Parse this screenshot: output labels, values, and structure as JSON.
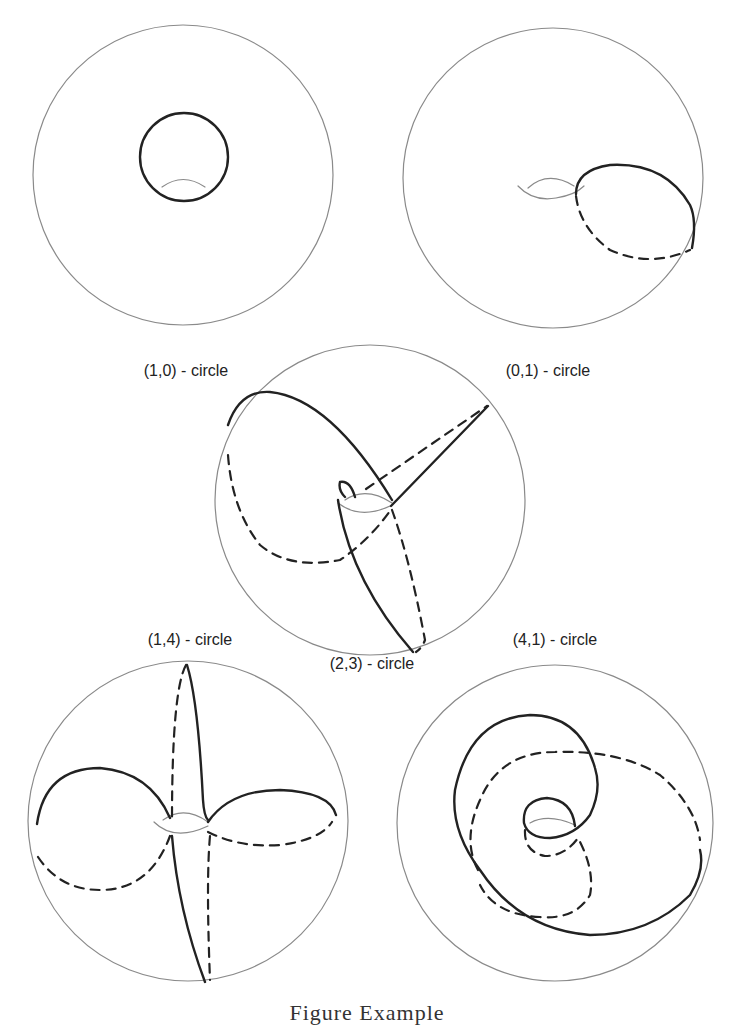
{
  "figure": {
    "panels": [
      {
        "id": "p10",
        "label": "(1,0) - circle"
      },
      {
        "id": "p01",
        "label": "(0,1) - circle"
      },
      {
        "id": "p23",
        "label": "(2,3) - circle"
      },
      {
        "id": "p14",
        "label": "(1,4) - circle"
      },
      {
        "id": "p41",
        "label": "(4,1) - circle"
      }
    ],
    "caption": "Figure        Example"
  },
  "colors": {
    "outline": "#8a8a8a",
    "curve": "#222222"
  }
}
